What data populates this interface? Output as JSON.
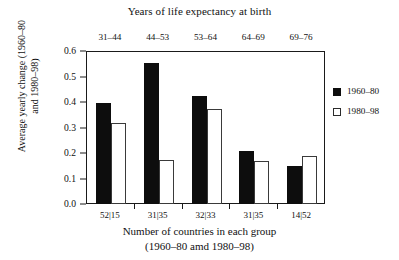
{
  "chart_data": {
    "type": "bar",
    "title": "Years of life expectancy at birth",
    "xlabel": "Number of countries in each group",
    "xlabel_line2": "(1960–80 amd 1980–98)",
    "ylabel": "Average yearly change (1960–80",
    "ylabel_line2": "and 1980–98)",
    "categories": [
      "31–44",
      "44–53",
      "53–64",
      "64–69",
      "69–76"
    ],
    "group_counts": [
      "52|15",
      "31|35",
      "32|33",
      "31|35",
      "14|52"
    ],
    "series": [
      {
        "name": "1960–80",
        "color": "#0d0d0d",
        "values": [
          0.395,
          0.552,
          0.425,
          0.208,
          0.15
        ]
      },
      {
        "name": "1980–98",
        "color": "#ffffff",
        "values": [
          0.317,
          0.172,
          0.372,
          0.17,
          0.19
        ]
      }
    ],
    "ylim": [
      0.0,
      0.6
    ],
    "yticks": [
      "0.0",
      "0.1",
      "0.2",
      "0.3",
      "0.4",
      "0.5",
      "0.6"
    ],
    "ytick_values": [
      0.0,
      0.1,
      0.2,
      0.3,
      0.4,
      0.5,
      0.6
    ],
    "grid": false,
    "legend_position": "right"
  },
  "legend": {
    "entries": [
      {
        "label": "1960–80",
        "swatch": "filled-square-icon"
      },
      {
        "label": "1980–98",
        "swatch": "empty-square-icon"
      }
    ]
  }
}
